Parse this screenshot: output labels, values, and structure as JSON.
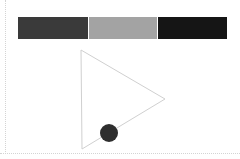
{
  "bars": [
    {
      "label": "dark-gray",
      "color": "#3a3a3a",
      "x": 18,
      "width": 70
    },
    {
      "label": "light-gray",
      "color": "#a3a3a3",
      "x": 89,
      "width": 68
    },
    {
      "label": "black",
      "color": "#151515",
      "x": 158,
      "width": 69
    }
  ],
  "triangle": {
    "points": "81,50 165,99 82,149",
    "stroke": "#d0d0d0"
  },
  "circle": {
    "cx": 109,
    "cy": 133,
    "r": 9,
    "fill": "#2e2e2e"
  }
}
